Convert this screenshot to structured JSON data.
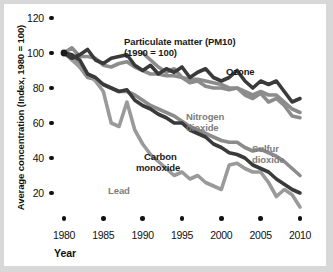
{
  "chart_data": {
    "type": "line",
    "title": "",
    "xlabel": "Year",
    "ylabel": "Average concentration (Index, 1980 = 100)",
    "xlim": [
      1980,
      2010
    ],
    "ylim": [
      0,
      125
    ],
    "xticks": [
      "1980",
      "1985",
      "1990",
      "1995",
      "2000",
      "2005",
      "2010"
    ],
    "yticks": [
      "120",
      "100",
      "80",
      "60",
      "40",
      "20"
    ],
    "grid": false,
    "legend": "inline annotations",
    "annotations": [
      {
        "text": "Particulate matter (PM10)",
        "series": "pm10"
      },
      {
        "text": "(1990 = 100)",
        "series": "pm10"
      },
      {
        "text": "Ozone",
        "series": "ozone"
      },
      {
        "text": "Nitrogen dioxide",
        "series": "no2"
      },
      {
        "text": "Sulfur dioxide",
        "series": "so2"
      },
      {
        "text": "Carbon monoxide",
        "series": "co"
      },
      {
        "text": "Lead",
        "series": "lead"
      }
    ],
    "series": [
      {
        "name": "Ozone",
        "color": "#3a3a3a",
        "x": [
          1980,
          1981,
          1982,
          1983,
          1984,
          1985,
          1986,
          1987,
          1988,
          1989,
          1990,
          1991,
          1992,
          1993,
          1994,
          1995,
          1996,
          1997,
          1998,
          1999,
          2000,
          2001,
          2002,
          2003,
          2004,
          2005,
          2006,
          2007,
          2008,
          2009,
          2010
        ],
        "values": [
          100,
          97,
          99,
          102,
          96,
          94,
          97,
          98,
          99,
          93,
          90,
          93,
          88,
          91,
          89,
          92,
          86,
          89,
          91,
          86,
          84,
          86,
          90,
          84,
          80,
          84,
          82,
          84,
          78,
          72,
          74
        ]
      },
      {
        "name": "Particulate matter (PM10)",
        "color": "#8c8c8c",
        "x": [
          1990,
          1991,
          1992,
          1993,
          1994,
          1995,
          1996,
          1997,
          1998,
          1999,
          2000,
          2001,
          2002,
          2003,
          2004,
          2005,
          2006,
          2007,
          2008,
          2009,
          2010
        ],
        "values": [
          100,
          96,
          92,
          89,
          91,
          86,
          83,
          84,
          81,
          80,
          80,
          79,
          80,
          76,
          74,
          77,
          72,
          74,
          70,
          64,
          63
        ]
      },
      {
        "name": "Nitrogen dioxide",
        "color": "#8c8c8c",
        "x": [
          1980,
          1981,
          1982,
          1983,
          1984,
          1985,
          1986,
          1987,
          1988,
          1989,
          1990,
          1991,
          1992,
          1993,
          1994,
          1995,
          1996,
          1997,
          1998,
          1999,
          2000,
          2001,
          2002,
          2003,
          2004,
          2005,
          2006,
          2007,
          2008,
          2009,
          2010
        ],
        "values": [
          100,
          103,
          98,
          98,
          97,
          93,
          92,
          94,
          95,
          92,
          90,
          88,
          88,
          87,
          87,
          86,
          85,
          85,
          84,
          83,
          82,
          80,
          80,
          78,
          76,
          78,
          76,
          76,
          72,
          68,
          66
        ]
      },
      {
        "name": "Sulfur dioxide",
        "color": "#8c8c8c",
        "x": [
          1980,
          1981,
          1982,
          1983,
          1984,
          1985,
          1986,
          1987,
          1988,
          1989,
          1990,
          1991,
          1992,
          1993,
          1994,
          1995,
          1996,
          1997,
          1998,
          1999,
          2000,
          2001,
          2002,
          2003,
          2004,
          2005,
          2006,
          2007,
          2008,
          2009,
          2010
        ],
        "values": [
          100,
          99,
          92,
          86,
          85,
          82,
          80,
          78,
          78,
          76,
          73,
          70,
          68,
          66,
          64,
          61,
          58,
          56,
          54,
          52,
          50,
          49,
          49,
          46,
          44,
          45,
          43,
          41,
          38,
          34,
          30
        ]
      },
      {
        "name": "Carbon monoxide",
        "color": "#3a3a3a",
        "x": [
          1980,
          1981,
          1982,
          1983,
          1984,
          1985,
          1986,
          1987,
          1988,
          1989,
          1990,
          1991,
          1992,
          1993,
          1994,
          1995,
          1996,
          1997,
          1998,
          1999,
          2000,
          2001,
          2002,
          2003,
          2004,
          2005,
          2006,
          2007,
          2008,
          2009,
          2010
        ],
        "values": [
          100,
          99,
          96,
          88,
          86,
          82,
          80,
          78,
          79,
          73,
          70,
          68,
          65,
          63,
          60,
          60,
          56,
          54,
          52,
          48,
          46,
          43,
          42,
          40,
          36,
          34,
          32,
          28,
          25,
          22,
          20
        ]
      },
      {
        "name": "Lead",
        "color": "#9a9a9a",
        "x": [
          1980,
          1981,
          1982,
          1983,
          1984,
          1985,
          1986,
          1987,
          1988,
          1989,
          1990,
          1991,
          1992,
          1993,
          1994,
          1995,
          1996,
          1997,
          1998,
          1999,
          2000,
          2001,
          2002,
          2003,
          2004,
          2005,
          2006,
          2007,
          2008,
          2009,
          2010
        ],
        "values": [
          100,
          96,
          92,
          88,
          84,
          78,
          60,
          58,
          72,
          56,
          48,
          42,
          38,
          34,
          30,
          32,
          28,
          30,
          26,
          24,
          22,
          36,
          37,
          34,
          32,
          32,
          26,
          18,
          22,
          19,
          12
        ]
      }
    ]
  },
  "axis": {
    "ylabel": "Average concentration (Index, 1980 = 100)",
    "xlabel": "Year"
  },
  "labels": {
    "pm10_line1": "Particulate matter (PM10)",
    "pm10_line2": "(1990 = 100)",
    "ozone": "Ozone",
    "no2_line1": "Nitrogen",
    "no2_line2": "dioxide",
    "so2_line1": "Sulfur",
    "so2_line2": "dioxide",
    "co_line1": "Carbon",
    "co_line2": "monoxide",
    "lead": "Lead"
  },
  "ytick_labels": [
    "120",
    "100",
    "80",
    "60",
    "40",
    "20"
  ],
  "xtick_labels": [
    "1980",
    "1985",
    "1990",
    "1995",
    "2000",
    "2005",
    "2010"
  ],
  "colors": {
    "dark_line": "#3a3a3a",
    "mid_line": "#8c8c8c",
    "light_line": "#9a9a9a",
    "background": "#ffffff",
    "page": "#d8d8d8"
  }
}
